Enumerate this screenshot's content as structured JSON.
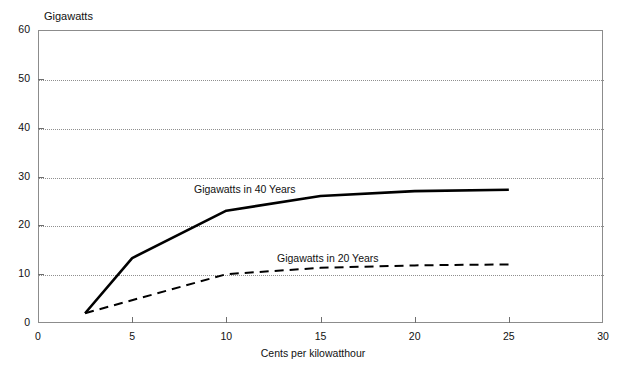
{
  "chart_data": {
    "type": "line",
    "title": "",
    "xlabel": "Cents per kilowatthour",
    "ylabel": "Gigawatts",
    "xlim": [
      0,
      30
    ],
    "ylim": [
      0,
      60
    ],
    "xticks": [
      0,
      5,
      10,
      15,
      20,
      25,
      30
    ],
    "yticks": [
      0,
      10,
      20,
      30,
      40,
      50,
      60
    ],
    "xtick_labels": [
      "0",
      "5",
      "10",
      "15",
      "20",
      "25",
      "30"
    ],
    "ytick_labels": [
      "0",
      "10",
      "20",
      "30",
      "40",
      "50",
      "60"
    ],
    "grid": {
      "horizontal": true,
      "vertical": false,
      "style": "dotted",
      "values": [
        10,
        20,
        30,
        40,
        50
      ]
    },
    "legend_position": "inline-annotations",
    "series": [
      {
        "name": "Gigawatts in 40 Years",
        "style": "solid",
        "color": "#000000",
        "width": 2.6,
        "x": [
          2.5,
          5,
          10,
          15,
          20,
          25
        ],
        "values": [
          2,
          13.3,
          23,
          26,
          27,
          27.3
        ]
      },
      {
        "name": "Gigawatts in 20 Years",
        "style": "dashed",
        "color": "#000000",
        "width": 2,
        "x": [
          2.5,
          10,
          15,
          20,
          25
        ],
        "values": [
          2,
          10,
          11.3,
          11.8,
          12
        ]
      }
    ],
    "annotations": [
      {
        "text": "Gigawatts in 40 Years",
        "x": 10.3,
        "y": 30.5
      },
      {
        "text": "Gigawatts in 20 Years",
        "x": 14.7,
        "y": 16.5
      }
    ]
  },
  "axes": {
    "y_title": "Gigawatts",
    "x_title": "Cents per kilowatthour"
  }
}
